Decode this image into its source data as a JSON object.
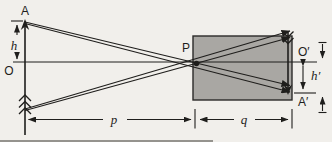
{
  "figure": {
    "description_type": "pinhole-image-formation-diagram",
    "labels": {
      "object_tip": "A",
      "axis_origin": "O",
      "pinhole": "P",
      "image_axis_point": "O′",
      "image_tip": "A′",
      "object_height": "h",
      "image_height": "h′",
      "object_distance": "p",
      "image_distance": "q"
    },
    "colors": {
      "ink": "#1f1e1c",
      "background": "#f1efeb",
      "box_fill": "#a9a7a3"
    }
  }
}
